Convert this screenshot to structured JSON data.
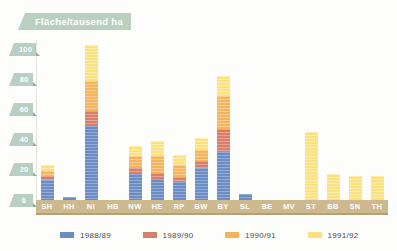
{
  "chart_data": {
    "type": "bar",
    "stacked": true,
    "title": "Fläche/tausend ha",
    "xlabel": "",
    "ylabel": "",
    "ylim": [
      0,
      106
    ],
    "yticks": [
      0,
      20,
      40,
      60,
      80,
      100
    ],
    "grid": false,
    "legend_position": "bottom",
    "categories": [
      "SH",
      "HH",
      "NI",
      "HB",
      "NW",
      "HE",
      "RP",
      "BW",
      "BY",
      "SL",
      "BE",
      "MV",
      "ST",
      "BB",
      "SN",
      "TH"
    ],
    "series": [
      {
        "name": "1988/89",
        "color": "#6b8cc4",
        "values": [
          13,
          2,
          49,
          0,
          17,
          14,
          12,
          21,
          32,
          4,
          0,
          0,
          0,
          0,
          0,
          0
        ]
      },
      {
        "name": "1989/90",
        "color": "#d97e6a",
        "values": [
          3,
          0,
          10,
          0,
          4,
          4,
          3,
          5,
          15,
          0,
          0,
          0,
          0,
          0,
          0,
          0
        ]
      },
      {
        "name": "1990/91",
        "color": "#f6b35c",
        "values": [
          3,
          0,
          20,
          0,
          8,
          11,
          8,
          7,
          22,
          0,
          0,
          0,
          0,
          0,
          0,
          0
        ]
      },
      {
        "name": "1991/92",
        "color": "#fbe17e",
        "values": [
          4,
          0,
          24,
          0,
          7,
          10,
          7,
          8,
          13,
          0,
          0,
          0,
          45,
          17,
          16,
          16
        ]
      }
    ]
  },
  "axis": {
    "yticks": [
      "100",
      "80",
      "60",
      "40",
      "20",
      "0"
    ]
  },
  "colors": {
    "title_tag": "#b9cfc2",
    "xaxis_band": "#cdb98d",
    "series_1988_89": "#6b8cc4",
    "series_1989_90": "#d97e6a",
    "series_1990_91": "#f6b35c",
    "series_1991_92": "#fbe17e"
  }
}
